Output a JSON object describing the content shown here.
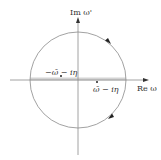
{
  "diagram": {
    "type": "complex-plane-contour",
    "axes": {
      "imag_label": "Im ω'",
      "real_label": "Re ω"
    },
    "poles": [
      {
        "label": "−ω̄ − iη",
        "position": "left, just below real axis"
      },
      {
        "label": "ω̄ − iη",
        "position": "right, just below real axis"
      }
    ],
    "contour": {
      "shape": "circle",
      "direction": "clockwise",
      "arrow_count": 2
    },
    "colors": {
      "line": "#888888",
      "band": "#cfcfcf",
      "text": "#333333",
      "background": "#ffffff"
    }
  }
}
